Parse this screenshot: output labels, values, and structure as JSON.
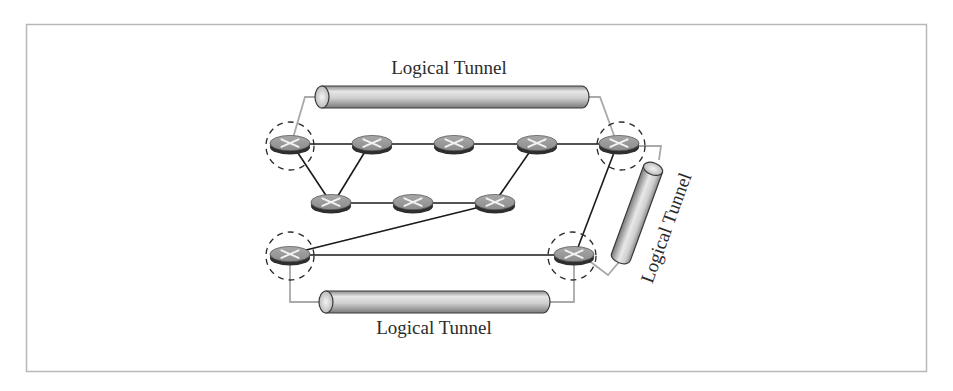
{
  "diagram": {
    "colors": {
      "frame": "#b8b8b8",
      "link": "#1a1a1a",
      "tunnel_connector": "#a9a9a9",
      "router_top": "#9a9a9a",
      "router_side": "#3a3a3a",
      "tunnel_body": "#c8c8c8",
      "label": "#2b2b2b"
    },
    "routers": [
      {
        "id": "r1",
        "x": 290,
        "y": 144,
        "tunnel_endpoint": true
      },
      {
        "id": "r2",
        "x": 372,
        "y": 144,
        "tunnel_endpoint": false
      },
      {
        "id": "r3",
        "x": 454,
        "y": 144,
        "tunnel_endpoint": false
      },
      {
        "id": "r4",
        "x": 537,
        "y": 144,
        "tunnel_endpoint": false
      },
      {
        "id": "r5",
        "x": 619,
        "y": 144,
        "tunnel_endpoint": true
      },
      {
        "id": "r6",
        "x": 331,
        "y": 203,
        "tunnel_endpoint": false
      },
      {
        "id": "r7",
        "x": 413,
        "y": 203,
        "tunnel_endpoint": false
      },
      {
        "id": "r8",
        "x": 495,
        "y": 203,
        "tunnel_endpoint": false
      },
      {
        "id": "r9",
        "x": 290,
        "y": 255,
        "tunnel_endpoint": true
      },
      {
        "id": "r10",
        "x": 574,
        "y": 255,
        "tunnel_endpoint": true
      }
    ],
    "links": [
      [
        "r1",
        "r2"
      ],
      [
        "r2",
        "r3"
      ],
      [
        "r3",
        "r4"
      ],
      [
        "r4",
        "r5"
      ],
      [
        "r1",
        "r6"
      ],
      [
        "r2",
        "r6"
      ],
      [
        "r6",
        "r7"
      ],
      [
        "r7",
        "r8"
      ],
      [
        "r4",
        "r8"
      ],
      [
        "r8",
        "r9"
      ],
      [
        "r9",
        "r10"
      ],
      [
        "r5",
        "r10"
      ]
    ],
    "tunnels": [
      {
        "id": "top",
        "label": "Logical Tunnel",
        "from": "r1",
        "to": "r5",
        "orientation": "horizontal"
      },
      {
        "id": "right",
        "label": "Logical Tunnel",
        "from": "r5",
        "to": "r10",
        "orientation": "diagonal"
      },
      {
        "id": "bottom",
        "label": "Logical Tunnel",
        "from": "r9",
        "to": "r10",
        "orientation": "horizontal"
      }
    ]
  }
}
